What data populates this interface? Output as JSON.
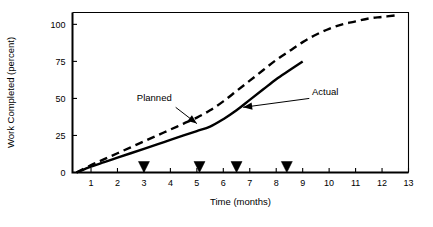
{
  "chart_data": {
    "type": "line",
    "title": "",
    "xlabel": "Time (months)",
    "ylabel": "Work Completed (percent)",
    "xlim": [
      0.3,
      13.0
    ],
    "ylim": [
      0,
      108
    ],
    "grid": false,
    "legend_position": "inline-annotations",
    "x_ticks": [
      1,
      2,
      3,
      4,
      5,
      6,
      7,
      8,
      9,
      10,
      11,
      12,
      13
    ],
    "x_tick_labels": [
      "1",
      "2",
      "3",
      "4",
      "5",
      "6",
      "7",
      "8",
      "9",
      "10",
      "11",
      "12",
      "13"
    ],
    "y_ticks": [
      0,
      25,
      50,
      75,
      100
    ],
    "y_tick_labels": [
      "0",
      "25",
      "50",
      "75",
      "100"
    ],
    "series": [
      {
        "name": "Planned",
        "style": "dashed",
        "color": "#000000",
        "x": [
          0.45,
          1.0,
          1.5,
          2.0,
          2.5,
          3.0,
          3.5,
          4.0,
          4.5,
          5.0,
          5.5,
          6.0,
          6.5,
          7.0,
          7.5,
          8.0,
          8.5,
          9.0,
          9.5,
          10.0,
          10.5,
          11.0,
          11.5,
          12.0,
          12.5
        ],
        "y": [
          0,
          5,
          9,
          13,
          17,
          21,
          25,
          29,
          33,
          37,
          42,
          48,
          55,
          62,
          69,
          76,
          82,
          88,
          93,
          97,
          100,
          102,
          104,
          105,
          106
        ]
      },
      {
        "name": "Actual",
        "style": "solid",
        "color": "#000000",
        "x": [
          0.45,
          1.0,
          1.5,
          2.0,
          2.5,
          3.0,
          3.5,
          4.0,
          4.5,
          5.0,
          5.5,
          6.0,
          6.5,
          7.0,
          7.5,
          8.0,
          8.5,
          9.0
        ],
        "y": [
          0,
          4,
          7,
          10,
          13,
          16,
          19,
          22,
          25,
          28,
          31,
          36,
          42,
          49,
          56,
          63,
          69,
          75
        ]
      }
    ],
    "markers": {
      "name": "milestone-markers",
      "shape": "triangle-down",
      "color": "#000000",
      "y": 0,
      "x": [
        3.0,
        5.1,
        6.5,
        8.4
      ]
    },
    "annotations": [
      {
        "name": "Planned",
        "label": "Planned",
        "label_x": 4.05,
        "label_y": 48,
        "arrow_from_x": 4.2,
        "arrow_from_y": 44,
        "arrow_to_x": 5.0,
        "arrow_to_y": 33
      },
      {
        "name": "Actual",
        "label": "Actual",
        "label_x": 9.35,
        "label_y": 52,
        "arrow_from_x": 9.25,
        "arrow_from_y": 50,
        "arrow_to_x": 6.75,
        "arrow_to_y": 44
      }
    ]
  }
}
